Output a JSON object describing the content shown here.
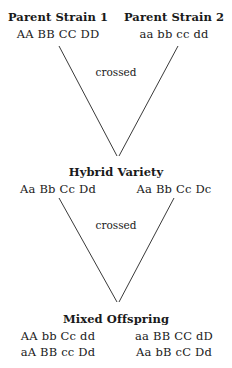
{
  "diagram": {
    "type": "genetic-cross-pedigree",
    "generations": [
      {
        "id": "parents",
        "entries": [
          {
            "name": "Parent Strain 1",
            "genotype": "AA BB CC DD"
          },
          {
            "name": "Parent Strain 2",
            "genotype": "aa bb cc dd"
          }
        ]
      },
      {
        "id": "hybrid",
        "title": "Hybrid Variety",
        "genotypes": [
          "Aa Bb Cc Dd",
          "Aa Bb Cc Dc"
        ]
      },
      {
        "id": "offspring",
        "title": "Mixed Offspring",
        "rows": [
          {
            "left": "AA bb Cc dd",
            "right": "aa BB CC dD"
          },
          {
            "left": "aA BB cc Dd",
            "right": "Aa bB cC Dd"
          }
        ]
      }
    ],
    "crosses": [
      {
        "id": "cross-1",
        "label": "crossed"
      },
      {
        "id": "cross-2",
        "label": "crossed"
      }
    ],
    "colors": {
      "background": "#ffffff",
      "text": "#1a1a1a",
      "line": "#3a3a3a"
    }
  }
}
